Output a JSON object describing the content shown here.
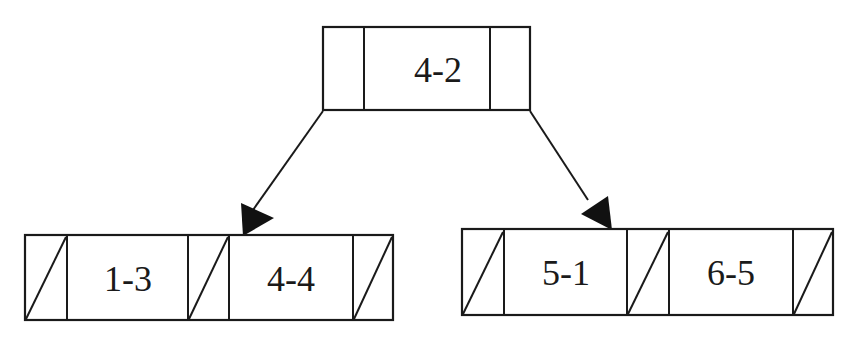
{
  "diagram": {
    "type": "b-tree",
    "root": {
      "keys": [
        "4-2"
      ]
    },
    "children": [
      {
        "keys": [
          "1-3",
          "4-4"
        ],
        "pointers": [
          "null",
          "null",
          "null"
        ]
      },
      {
        "keys": [
          "5-1",
          "6-5"
        ],
        "pointers": [
          "null",
          "null",
          "null"
        ]
      }
    ],
    "edges": [
      {
        "from": "root",
        "to": "child-0"
      },
      {
        "from": "root",
        "to": "child-1"
      }
    ],
    "colors": {
      "stroke": "#1a1a1a",
      "background": "#ffffff"
    }
  }
}
